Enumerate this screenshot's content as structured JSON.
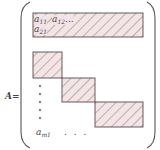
{
  "matrix": {
    "name": "A",
    "equals_label": "A=",
    "entries": {
      "a11": {
        "base": "a",
        "sub": "11"
      },
      "a12": {
        "base": "a",
        "sub": "12",
        "trail": "..."
      },
      "a21": {
        "base": "a",
        "sub": "21"
      },
      "am1": {
        "base": "a",
        "sub": "m1"
      }
    },
    "horizontal_ellipsis": ". . .",
    "vertical_dots_count": 5
  },
  "blocks": [
    {
      "id": "block-1",
      "x": 33,
      "y": 13,
      "w": 110,
      "h": 24
    },
    {
      "id": "block-2",
      "x": 33,
      "y": 52,
      "w": 29,
      "h": 26
    },
    {
      "id": "block-3",
      "x": 62,
      "y": 78,
      "w": 33,
      "h": 24
    },
    {
      "id": "block-4",
      "x": 95,
      "y": 102,
      "w": 48,
      "h": 25
    }
  ],
  "colors": {
    "block_fill": "#f3e4e6",
    "hatch": "#6b5a5e",
    "border": "#5a4a4e",
    "bracket": "#555555",
    "text": "#444444"
  }
}
